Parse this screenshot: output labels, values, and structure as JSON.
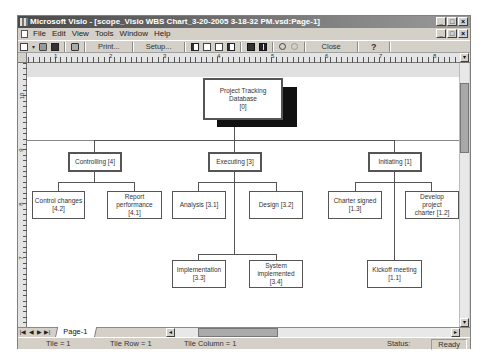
{
  "window": {
    "title": "Microsoft Visio - [scope_Visio WBS Chart_3-20-2005 3-18-32 PM.vsd:Page-1]",
    "controls": [
      "_",
      "□",
      "×"
    ]
  },
  "menubar": {
    "items": [
      "File",
      "Edit",
      "View",
      "Tools",
      "Window",
      "Help"
    ],
    "doc_controls": [
      "_",
      "□",
      "×"
    ]
  },
  "toolbar": {
    "print_label": "Print...",
    "setup_label": "Setup...",
    "close_label": "Close",
    "help_label": "?"
  },
  "ruler": {
    "horizontal_labels": [
      "1",
      "2",
      "3",
      "4",
      "5",
      "6",
      "7",
      "8"
    ],
    "vertical_labels": [
      "10",
      "9",
      "8",
      "7"
    ]
  },
  "diagram": {
    "root": {
      "label": "Project Tracking Database",
      "id": "[0]"
    },
    "phases": [
      {
        "label": "Controlling [4]",
        "children": [
          {
            "label": "Control changes",
            "id": "[4.2]"
          },
          {
            "label": "Report performance [4.1]",
            "id": ""
          }
        ]
      },
      {
        "label": "Executing [3]",
        "children": [
          {
            "label": "Analysis [3.1]",
            "id": ""
          },
          {
            "label": "Design [3.2]",
            "id": ""
          },
          {
            "label": "Implementation",
            "id": "[3.3]"
          },
          {
            "label": "System implemented [3.4]",
            "id": ""
          }
        ]
      },
      {
        "label": "Initiating [1]",
        "children": [
          {
            "label": "Charter signed",
            "id": "[1.3]"
          },
          {
            "label": "Develop project charter [1.2]",
            "id": ""
          },
          {
            "label": "Kickoff meeting",
            "id": "[1.1]"
          }
        ]
      }
    ]
  },
  "tabs": {
    "nav": [
      "|◀",
      "◀",
      "▶",
      "▶|"
    ],
    "page_tab": "Page-1"
  },
  "statusbar": {
    "tile": "Tile =  1",
    "tile_row": "Tile Row =  1",
    "tile_column": "Tile Column =  1",
    "status_label": "Status:",
    "status_value": "Ready"
  }
}
